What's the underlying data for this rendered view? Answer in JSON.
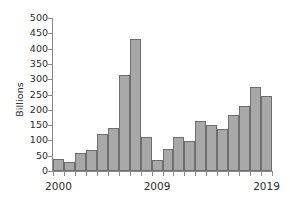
{
  "chart_data": {
    "type": "bar",
    "title": "",
    "xlabel": "",
    "ylabel": "Billions",
    "ylim": [
      0,
      500
    ],
    "ytick_step": 50,
    "yticks": [
      0,
      50,
      100,
      150,
      200,
      250,
      300,
      350,
      400,
      450,
      500
    ],
    "ytick_labels": [
      "0",
      "50",
      "100",
      "150",
      "200",
      "250",
      "300",
      "350",
      "400",
      "450",
      "500"
    ],
    "grid": false,
    "legend": null,
    "categories": [
      "2000",
      "2001",
      "2002",
      "2003",
      "2004",
      "2005",
      "2006",
      "2007",
      "2008",
      "2009",
      "2010",
      "2011",
      "2012",
      "2013",
      "2014",
      "2015",
      "2016",
      "2017",
      "2018",
      "2019"
    ],
    "xtick_labels": [
      "2000",
      "2009",
      "2019"
    ],
    "xtick_label_categories": [
      "2000",
      "2009",
      "2019"
    ],
    "values": [
      40,
      31,
      59,
      70,
      120,
      142,
      315,
      430,
      111,
      37,
      72,
      111,
      97,
      162,
      152,
      138,
      183,
      213,
      273,
      244
    ],
    "bar_fill_color": "#a8a8a8",
    "bar_edge_color": "#6e6e6e",
    "axis_color": "#8a8a8a",
    "text_color": "#2b2b2b",
    "background_color": "#ffffff"
  }
}
